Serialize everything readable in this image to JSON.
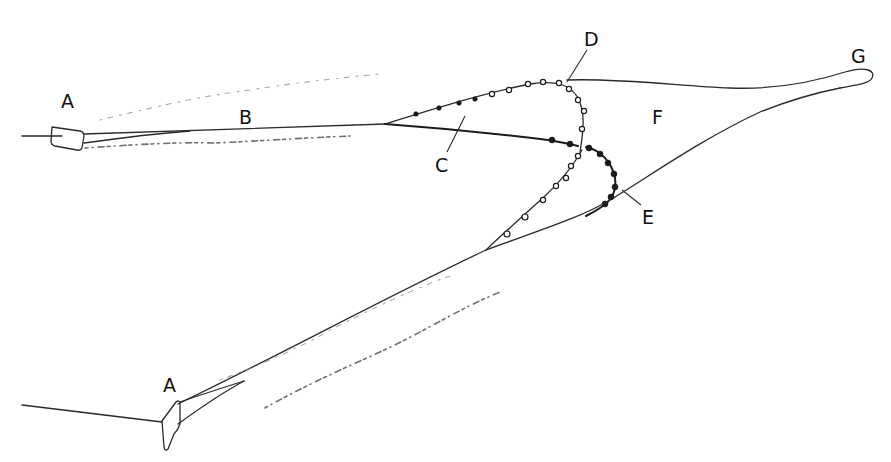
{
  "diagram": {
    "type": "pair-trawl towing schematic",
    "labels": {
      "A_top": "A",
      "A_bottom": "A",
      "B": "B",
      "C": "C",
      "D": "D",
      "E": "E",
      "F": "F",
      "G": "G"
    },
    "components": [
      {
        "id": "A",
        "description": "towing vessel (two boats)"
      },
      {
        "id": "B",
        "description": "tow warp"
      },
      {
        "id": "C",
        "description": "wing / bridle area"
      },
      {
        "id": "D",
        "description": "headline with floats"
      },
      {
        "id": "E",
        "description": "footrope with weights"
      },
      {
        "id": "F",
        "description": "net body"
      },
      {
        "id": "G",
        "description": "codend"
      }
    ],
    "colors": {
      "ink": "#1a1a1a",
      "background": "#ffffff"
    }
  }
}
